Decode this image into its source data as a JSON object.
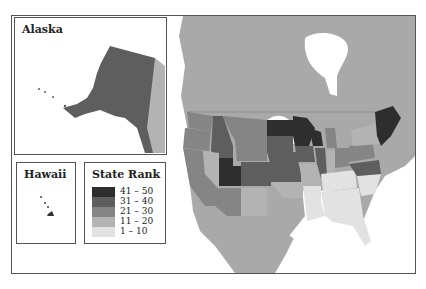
{
  "insets": {
    "alaska": {
      "title": "Alaska"
    },
    "hawaii": {
      "title": "Hawaii"
    }
  },
  "legend": {
    "title": "State Rank",
    "items": [
      {
        "label": "41 – 50",
        "color": "#2e2e2e"
      },
      {
        "label": "31 – 40",
        "color": "#5e5e5e"
      },
      {
        "label": "21 – 30",
        "color": "#858585"
      },
      {
        "label": "11 – 20",
        "color": "#b3b3b3"
      },
      {
        "label": "1 – 10",
        "color": "#e2e2e2"
      }
    ]
  },
  "colors": {
    "land_other": "#a9a9a9",
    "water": "#ffffff",
    "border": "#555555"
  }
}
